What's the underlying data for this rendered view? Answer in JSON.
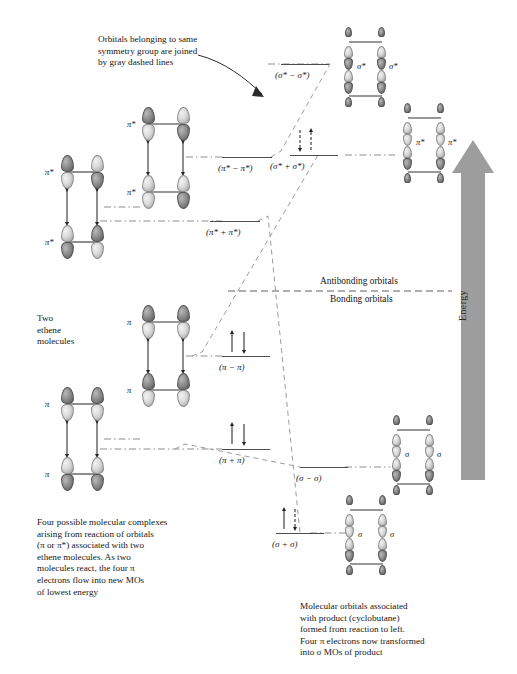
{
  "figure": {
    "type": "molecular-orbital-correlation-diagram"
  },
  "annotations": {
    "dashed_note": "Orbitals belonging to same\nsymmetry group are joined\nby gray dashed lines",
    "reactant_label": "Two\nethene\nmolecules",
    "left_caption": "Four possible molecular complexes\narising from reaction of orbitals\n(π or π*) associated with two\nethene molecules. As two\nmolecules react, the four π\nelectrons flow into new MOs\nof lowest energy",
    "right_caption": "Molecular orbitals associated\nwith product (cyclobutane)\nformed from reaction to left.\nFour π electrons now transformed\ninto σ MOs of product",
    "antibonding_zone": "Antibonding orbitals",
    "bonding_zone": "Bonding orbitals",
    "energy_axis": "Energy"
  },
  "reactant_orbitals": [
    {
      "name": "pi-star-upper-a",
      "label": "π*"
    },
    {
      "name": "pi-star-upper-b",
      "label": "π*"
    },
    {
      "name": "pi-lower-a",
      "label": "π"
    },
    {
      "name": "pi-lower-b",
      "label": "π"
    }
  ],
  "complex_orbitals": [
    {
      "name": "pi-star-complex-upper",
      "label": "π*"
    },
    {
      "name": "pi-star-complex-lower",
      "label": "π*"
    },
    {
      "name": "pi-complex-upper",
      "label": "π"
    },
    {
      "name": "pi-complex-lower",
      "label": "π"
    }
  ],
  "product_orbitals": [
    {
      "name": "sigma-star-product-a",
      "label": "σ*"
    },
    {
      "name": "sigma-star-product-b",
      "label": "σ*"
    },
    {
      "name": "pi-star-product-a",
      "label": "π*"
    },
    {
      "name": "pi-star-product-b",
      "label": "π*"
    },
    {
      "name": "sigma-product-upper-a",
      "label": "σ"
    },
    {
      "name": "sigma-product-upper-b",
      "label": "σ"
    },
    {
      "name": "sigma-product-lower-a",
      "label": "σ"
    },
    {
      "name": "sigma-product-lower-b",
      "label": "σ"
    }
  ],
  "energy_levels": [
    {
      "id": "pi-star-minus-pi-star",
      "label": "(π* − π*)",
      "side": "left",
      "electrons": 0,
      "character": "antibonding"
    },
    {
      "id": "pi-star-plus-pi-star",
      "label": "(π* + π*)",
      "side": "left",
      "electrons": 0,
      "character": "antibonding"
    },
    {
      "id": "pi-minus-pi",
      "label": "(π − π)",
      "side": "left",
      "electrons": 2,
      "character": "bonding"
    },
    {
      "id": "pi-plus-pi",
      "label": "(π + π)",
      "side": "left",
      "electrons": 2,
      "character": "bonding"
    },
    {
      "id": "sigma-star-minus-sigma-star",
      "label": "(σ* − σ*)",
      "side": "right",
      "electrons": 0,
      "character": "antibonding"
    },
    {
      "id": "sigma-star-plus-sigma-star",
      "label": "(σ* + σ*)",
      "side": "right",
      "electrons": 0,
      "character": "antibonding"
    },
    {
      "id": "sigma-minus-sigma",
      "label": "(σ − σ)",
      "side": "right",
      "electrons": 0,
      "character": "bonding"
    },
    {
      "id": "sigma-plus-sigma",
      "label": "(σ + σ)",
      "side": "right",
      "electrons": 2,
      "character": "bonding"
    }
  ]
}
